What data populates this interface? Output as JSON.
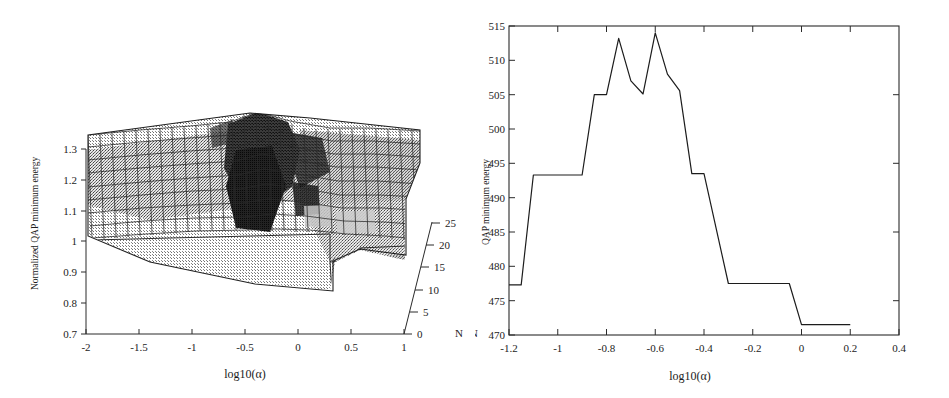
{
  "figure": {
    "panels": [
      "surface-plot",
      "line-plot"
    ]
  },
  "left_panel": {
    "name": "3d-surface-plot",
    "ylabel": "Normalized QAP minimum energy",
    "xlabel": "log10(α)",
    "zlabel": "N",
    "yticks": [
      "0.7",
      "0.8",
      "0.9",
      "1",
      "1.1",
      "1.2",
      "1.3"
    ],
    "xticks": [
      "-2",
      "-1.5",
      "-1",
      "-0.5",
      "0",
      "0.5",
      "1"
    ],
    "nticks": [
      "0",
      "5",
      "10",
      "15",
      "20",
      "25"
    ]
  },
  "right_panel": {
    "name": "line-plot",
    "ylabel": "QAP minimum energy",
    "xlabel": "log10(α)",
    "nlabel": "N",
    "yticks": [
      "470",
      "475",
      "480",
      "485",
      "490",
      "495",
      "500",
      "505",
      "510",
      "515"
    ],
    "xticks": [
      "-1.2",
      "-1",
      "-0.8",
      "-0.6",
      "-0.4",
      "-0.2",
      "0",
      "0.2",
      "0.4"
    ]
  },
  "chart_data": [
    {
      "type": "surface",
      "title": "",
      "xlabel": "log10(α)",
      "ylabel": "Normalized QAP minimum energy",
      "zlabel": "N",
      "xlim": [
        -2,
        1
      ],
      "ylim": [
        0.7,
        1.3
      ],
      "zlim": [
        0,
        25
      ],
      "grid": true,
      "legend": "none",
      "description": "Mesh surface of normalized QAP minimum energy versus log10(alpha) and problem size N; broad plateau near 1.03 with a sharp dark ridge/peak around log10(alpha) = -0.5 reaching about 1.35, and step-down terraces at the large-alpha / small-N corner.",
      "x": [
        -2,
        -1.9,
        -1.8,
        -1.7,
        -1.6,
        -1.5,
        -1.4,
        -1.3,
        -1.2,
        -1.1,
        -1.0,
        -0.9,
        -0.8,
        -0.7,
        -0.6,
        -0.5,
        -0.4,
        -0.3,
        -0.2,
        -0.1,
        0.0,
        0.1,
        0.2,
        0.3,
        0.4,
        0.5,
        0.6,
        0.7,
        0.8,
        0.9,
        1.0
      ],
      "z": [
        5,
        10,
        15,
        20,
        25
      ],
      "surface_profile_mean": [
        1.03,
        1.03,
        1.03,
        1.035,
        1.04,
        1.045,
        1.05,
        1.06,
        1.07,
        1.09,
        1.11,
        1.14,
        1.18,
        1.24,
        1.3,
        1.35,
        1.31,
        1.25,
        1.2,
        1.16,
        1.14,
        1.13,
        1.12,
        1.12,
        1.11,
        1.11,
        1.1,
        1.1,
        1.1,
        1.09,
        1.09
      ]
    },
    {
      "type": "line",
      "title": "",
      "xlabel": "log10(α)",
      "ylabel": "QAP minimum energy",
      "xlim": [
        -1.2,
        0.4
      ],
      "ylim": [
        470,
        515
      ],
      "grid": false,
      "legend": "none",
      "x": [
        -1.2,
        -1.15,
        -1.1,
        -0.9,
        -0.85,
        -0.8,
        -0.75,
        -0.7,
        -0.65,
        -0.6,
        -0.55,
        -0.5,
        -0.45,
        -0.4,
        -0.3,
        -0.05,
        0.0,
        0.2
      ],
      "values": [
        477.3,
        477.3,
        493.3,
        493.3,
        505.0,
        505.0,
        513.2,
        507.0,
        505.1,
        514.0,
        508.0,
        505.6,
        493.5,
        493.5,
        477.5,
        477.5,
        471.5,
        471.5
      ]
    }
  ]
}
